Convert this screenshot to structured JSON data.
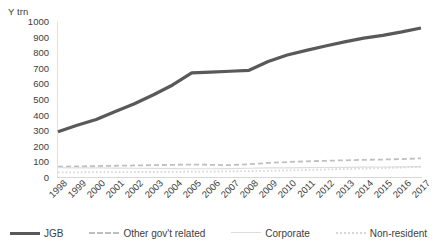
{
  "chart_data": {
    "type": "line",
    "title": "",
    "xlabel": "",
    "ylabel": "Y trn",
    "y_unit_label": "Y trn",
    "ylim": [
      0,
      1000
    ],
    "y_ticks": [
      1000,
      900,
      800,
      700,
      600,
      500,
      400,
      300,
      200,
      100,
      0
    ],
    "grid": false,
    "legend_position": "bottom",
    "categories": [
      "1998",
      "1999",
      "2000",
      "2001",
      "2002",
      "2003",
      "2004",
      "2005",
      "2006",
      "2007",
      "2008",
      "2009",
      "2010",
      "2011",
      "2012",
      "2013",
      "2014",
      "2015",
      "2016",
      "2017"
    ],
    "series": [
      {
        "name": "JGB",
        "color": "#595959",
        "style": "solid",
        "width": 3.2,
        "values": [
          290,
          332,
          368,
          420,
          470,
          527,
          590,
          668,
          672,
          678,
          684,
          740,
          782,
          812,
          840,
          866,
          890,
          908,
          930,
          955
        ]
      },
      {
        "name": "Other gov't related",
        "color": "#bfbfbf",
        "style": "dashed",
        "width": 1.8,
        "values": [
          66,
          68,
          70,
          72,
          74,
          76,
          78,
          80,
          78,
          76,
          82,
          90,
          96,
          100,
          104,
          107,
          110,
          112,
          115,
          120
        ]
      },
      {
        "name": "Corporate",
        "color": "#dcdcdc",
        "style": "solid",
        "width": 1.2,
        "values": [
          60,
          59,
          58,
          57,
          56,
          55,
          54,
          53,
          53,
          54,
          56,
          58,
          59,
          60,
          61,
          62,
          63,
          64,
          65,
          66
        ]
      },
      {
        "name": "Non-resident",
        "color": "#d6d6d6",
        "style": "dotted",
        "width": 1.8,
        "values": [
          30,
          30,
          31,
          31,
          32,
          32,
          33,
          34,
          35,
          36,
          38,
          40,
          42,
          45,
          48,
          51,
          54,
          57,
          61,
          65
        ]
      }
    ]
  },
  "legend": {
    "items": [
      {
        "label": "JGB"
      },
      {
        "label": "Other gov't related"
      },
      {
        "label": "Corporate"
      },
      {
        "label": "Non-resident"
      }
    ]
  }
}
